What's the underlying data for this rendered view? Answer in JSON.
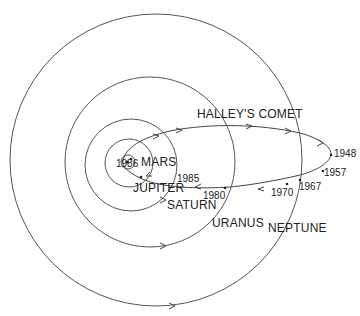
{
  "diagram": {
    "labels": {
      "comet": "HALLEY'S COMET",
      "mars": "MARS",
      "jupiter": "JUPITER",
      "saturn": "SATURN",
      "uranus": "URANUS",
      "neptune": "NEPTUNE"
    },
    "years": {
      "y1986": "1986",
      "y1985": "1985",
      "y1980": "1980",
      "y1970": "1970",
      "y1967": "1967",
      "y1957": "1957",
      "y1948": "1948"
    },
    "colors": {
      "line": "#555555",
      "text": "#222222",
      "background": "#ffffff"
    }
  }
}
